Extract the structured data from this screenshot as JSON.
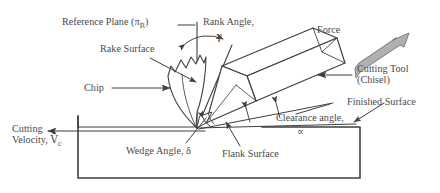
{
  "figure": {
    "type": "engineering-diagram",
    "background": "#ffffff",
    "line_color": "#3f3f3f",
    "text_color": "#4a4a4a",
    "force_arrow_fill": "#b0b0b0"
  },
  "labels": {
    "reference_plane": "Reference Plane (π",
    "reference_plane_sub": "R",
    "reference_plane_close": ")",
    "rake_angle": "Rank Angle,",
    "rake_angle_symbol": "γ",
    "rake_surface": "Rake Surface",
    "chip": "Chip",
    "force": "Force",
    "cutting_tool_line1": "Cutting Tool",
    "cutting_tool_line2": "(Chisel)",
    "finished_surface": "Finished Surface",
    "clearance_angle": "Clearance angle,",
    "clearance_angle_symbol": "∝",
    "flank_surface": "Flank Surface",
    "wedge_angle": "Wedge Angle, δ",
    "cutting_velocity_line1": "Cutting",
    "cutting_velocity_line2": "Velocity,",
    "cutting_velocity_symbol": "V̄",
    "cutting_velocity_sub": "c"
  },
  "geometry": {
    "workpiece": {
      "left": 78,
      "right": 360,
      "top": 127,
      "bottom": 178
    },
    "reference_plane_line": {
      "x": 197,
      "y_top": 22,
      "y_bottom": 127
    },
    "tool_tip": {
      "x": 197,
      "y": 127
    },
    "angles": {
      "rake_angle_deg": 30,
      "clearance_angle_deg": 10,
      "wedge_angle_deg": 50
    }
  }
}
